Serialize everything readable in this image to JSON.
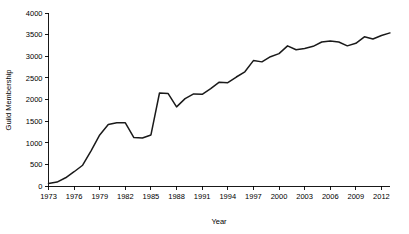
{
  "chart_data": {
    "type": "line",
    "title": "",
    "xlabel": "Year",
    "ylabel": "Guild Membership",
    "xlim": [
      1973,
      2013
    ],
    "ylim": [
      0,
      4000
    ],
    "grid": false,
    "legend": null,
    "x_ticks": [
      1973,
      1976,
      1979,
      1982,
      1985,
      1988,
      1991,
      1994,
      1997,
      2000,
      2003,
      2006,
      2009,
      2012
    ],
    "y_ticks": [
      0,
      500,
      1000,
      1500,
      2000,
      2500,
      3000,
      3500,
      4000
    ],
    "series": [
      {
        "name": "Guild Membership",
        "color": "#1a1a1a",
        "x": [
          1973,
          1974,
          1975,
          1976,
          1977,
          1978,
          1979,
          1980,
          1981,
          1982,
          1983,
          1984,
          1985,
          1986,
          1987,
          1988,
          1989,
          1990,
          1991,
          1992,
          1993,
          1994,
          1995,
          1996,
          1997,
          1998,
          1999,
          2000,
          2001,
          2002,
          2003,
          2004,
          2005,
          2006,
          2007,
          2008,
          2009,
          2010,
          2011,
          2012,
          2013
        ],
        "values": [
          60,
          90,
          190,
          330,
          480,
          820,
          1180,
          1420,
          1460,
          1460,
          1120,
          1110,
          1180,
          2150,
          2140,
          1830,
          2020,
          2130,
          2120,
          2250,
          2400,
          2390,
          2520,
          2640,
          2900,
          2870,
          2990,
          3060,
          3240,
          3150,
          3180,
          3230,
          3330,
          3350,
          3330,
          3240,
          3300,
          3450,
          3400,
          3480,
          3540
        ]
      }
    ]
  },
  "axes": {
    "y_label_text": "Guild Membership",
    "x_label_text": "Year"
  }
}
